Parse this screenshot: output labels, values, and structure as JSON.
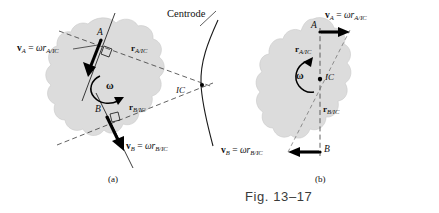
{
  "figure": {
    "caption": "Fig. 13–17",
    "panel_a_label": "(a)",
    "panel_b_label": "(b)",
    "centrode_label": "Centrode"
  },
  "symbols": {
    "v": "v",
    "omega": "ω",
    "r": "r",
    "equals": "=",
    "point_a": "A",
    "point_b": "B",
    "ic": "IC",
    "sub_a": "A",
    "sub_b": "B",
    "sub_a_ic": "A/IC",
    "sub_b_ic": "B/IC"
  },
  "panel_a": {
    "name": "(a)",
    "va_equation": {
      "vector": "v",
      "vector_sub": "A",
      "equals": "=",
      "omega": "ω",
      "r": "r",
      "r_sub": "A/IC"
    },
    "vb_equation": {
      "vector": "v",
      "vector_sub": "B",
      "equals": "=",
      "omega": "ω",
      "r": "r",
      "r_sub": "B/IC"
    },
    "r_a_label": {
      "r": "r",
      "sub": "A/IC"
    },
    "r_b_label": {
      "r": "r",
      "sub": "B/IC"
    },
    "omega_label": "ω",
    "omega_sense": "clockwise",
    "ic_label": "IC",
    "point_a_label": "A",
    "point_b_label": "B",
    "centrode_label": "Centrode"
  },
  "panel_b": {
    "name": "(b)",
    "va_equation": {
      "vector": "v",
      "vector_sub": "A",
      "equals": "=",
      "omega": "ω",
      "r": "r",
      "r_sub": "A/IC"
    },
    "vb_equation": {
      "vector": "v",
      "vector_sub": "B",
      "equals": "=",
      "omega": "ω",
      "r": "r",
      "r_sub": "B/IC"
    },
    "r_a_label": {
      "r": "r",
      "sub": "A/IC"
    },
    "r_b_label": {
      "r": "r",
      "sub": "B/IC"
    },
    "omega_label": "ω",
    "omega_sense": "counterclockwise",
    "ic_label": "IC",
    "point_a_label": "A",
    "point_b_label": "B"
  },
  "colors": {
    "background": "#ffffff",
    "body_fill": "#dcdcdc",
    "body_outline": "#c9c9c9",
    "ink": "#000000",
    "dashed_line": "#3a3a3a",
    "caption_text": "#3a3a3a"
  }
}
